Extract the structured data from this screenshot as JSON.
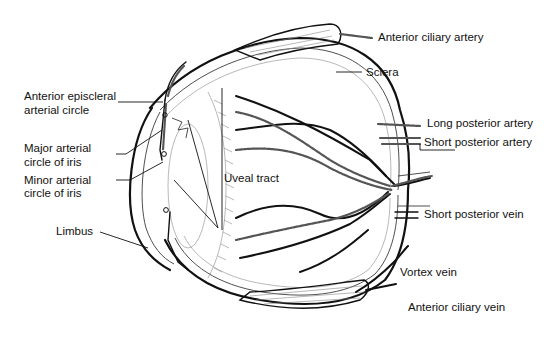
{
  "figure": {
    "colors": {
      "ink": "#111111",
      "background": "#ffffff",
      "artery_hatch": "#555555"
    }
  },
  "labels": {
    "anterior_ciliary_artery": "Anterior ciliary artery",
    "sclera": "Sclera",
    "long_posterior_artery": "Long posterior artery",
    "short_posterior_artery": "Short posterior artery",
    "short_posterior_vein": "Short posterior vein",
    "vortex_vein": "Vortex vein",
    "anterior_ciliary_vein": "Anterior ciliary vein",
    "anterior_episcleral_line1": "Anterior episcleral",
    "anterior_episcleral_line2": "arterial circle",
    "major_arterial_line1": "Major arterial",
    "major_arterial_line2": "circle of iris",
    "minor_arterial_line1": "Minor arterial",
    "minor_arterial_line2": "circle of iris",
    "uveal_tract": "Uveal tract",
    "limbus": "Limbus"
  }
}
